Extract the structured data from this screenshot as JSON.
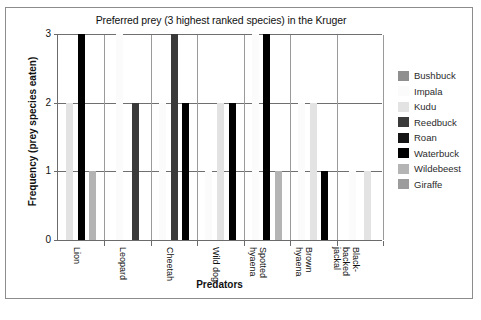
{
  "chart_data": {
    "type": "bar",
    "title": "Preferred prey (3 highest ranked species) in the Kruger",
    "xlabel": "Predators",
    "ylabel": "Frequency (prey species eaten)",
    "ylim": [
      0,
      3
    ],
    "yticks": [
      "0",
      "1",
      "2",
      "3"
    ],
    "grid": true,
    "legend_position": "right",
    "categories": [
      "Lion",
      "Leopard",
      "Cheetah",
      "Wild dog",
      "Spotted hyaena",
      "Brown hyaena",
      "Black-backed jackal"
    ],
    "series": [
      {
        "name": "Bushbuck",
        "color": "#8f8f8f",
        "values": [
          0,
          0,
          0,
          0,
          0,
          0,
          0
        ]
      },
      {
        "name": "Impala",
        "color": "#fbfbfb",
        "values": [
          0,
          3,
          2,
          1,
          3,
          2,
          1
        ]
      },
      {
        "name": "Kudu",
        "color": "#e3e3e3",
        "values": [
          2,
          0,
          0,
          2,
          0,
          2,
          1
        ]
      },
      {
        "name": "Reedbuck",
        "color": "#3a3a3a",
        "values": [
          0,
          2,
          3,
          0,
          0,
          0,
          0
        ]
      },
      {
        "name": "Roan",
        "color": "#151515",
        "values": [
          0,
          0,
          0,
          0,
          0,
          0,
          0
        ]
      },
      {
        "name": "Waterbuck",
        "color": "#000000",
        "values": [
          3,
          0,
          2,
          2,
          3,
          1,
          0
        ]
      },
      {
        "name": "Wildebeest",
        "color": "#b4b4b4",
        "values": [
          1,
          0,
          0,
          0,
          1,
          0,
          0
        ]
      },
      {
        "name": "Giraffe",
        "color": "#9c9c9c",
        "values": [
          0,
          0,
          0,
          0,
          0,
          0,
          0
        ]
      }
    ]
  }
}
